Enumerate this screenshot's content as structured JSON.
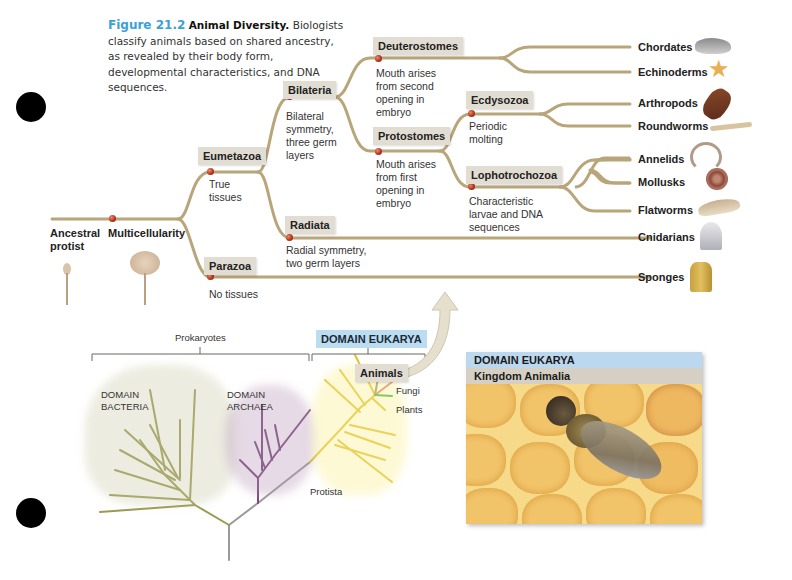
{
  "caption": {
    "figure_label": "Figure 21.2",
    "title": "Animal Diversity.",
    "text": "Biologists classify animals based on shared ancestry, as revealed by their body form, developmental characteristics, and DNA sequences."
  },
  "tree": {
    "root": {
      "label_line1": "Ancestral",
      "label_line2": "protist"
    },
    "multicellularity": {
      "label": "Multicellularity"
    },
    "clades": {
      "eumetazoa": {
        "label": "Eumetazoa",
        "desc": [
          "True",
          "tissues"
        ]
      },
      "parazoa": {
        "label": "Parazoa",
        "desc": [
          "No tissues"
        ]
      },
      "bilateria": {
        "label": "Bilateria",
        "desc": [
          "Bilateral",
          "symmetry,",
          "three germ",
          "layers"
        ]
      },
      "radiata": {
        "label": "Radiata",
        "desc": [
          "Radial symmetry,",
          "two germ layers"
        ]
      },
      "deuterostomes": {
        "label": "Deuterostomes",
        "desc": [
          "Mouth arises",
          "from second",
          "opening in",
          "embryo"
        ]
      },
      "protostomes": {
        "label": "Protostomes",
        "desc": [
          "Mouth arises",
          "from first",
          "opening in",
          "embryo"
        ]
      },
      "ecdysozoa": {
        "label": "Ecdysozoa",
        "desc": [
          "Periodic",
          "molting"
        ]
      },
      "lophotrochozoa": {
        "label": "Lophotrochozoa",
        "desc": [
          "Characteristic",
          "larvae and DNA",
          "sequences"
        ]
      }
    },
    "taxa": [
      {
        "name": "Chordates",
        "icon": "shark-icon"
      },
      {
        "name": "Echinoderms",
        "icon": "starfish-icon"
      },
      {
        "name": "Arthropods",
        "icon": "lobster-icon"
      },
      {
        "name": "Roundworms",
        "icon": "roundworm-icon"
      },
      {
        "name": "Annelids",
        "icon": "earthworm-icon"
      },
      {
        "name": "Mollusks",
        "icon": "snail-icon"
      },
      {
        "name": "Flatworms",
        "icon": "flatworm-icon"
      },
      {
        "name": "Cnidarians",
        "icon": "jellyfish-icon"
      },
      {
        "name": "Sponges",
        "icon": "sponge-icon"
      }
    ],
    "colors": {
      "branch": "#b8a67a",
      "node": "#b0301a",
      "clade_bg": "#e2ddd2"
    }
  },
  "domains": {
    "prokaryotes_label": "Prokaryotes",
    "eukarya_label": "DOMAIN EUKARYA",
    "bacteria": [
      "DOMAIN",
      "BACTERIA"
    ],
    "archaea": [
      "DOMAIN",
      "ARCHAEA"
    ],
    "animals": "Animals",
    "fungi": "Fungi",
    "plants": "Plants",
    "protista": "Protista",
    "colors": {
      "bacteria": "#9a9a50",
      "archaea": "#7a4a7a",
      "eukarya": "#e0c030",
      "fungi": "#e07a7a",
      "plants": "#3ab040",
      "stem": "#9a9a9a"
    }
  },
  "photo_panel": {
    "header1": "DOMAIN EUKARYA",
    "header2": "Kingdom Animalia",
    "image": "honeybee-on-honeycomb"
  }
}
